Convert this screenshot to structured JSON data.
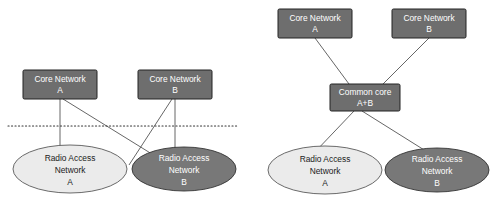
{
  "diagram": {
    "colors": {
      "box_fill": "#6e6e6e",
      "box_stroke": "#222222",
      "ellipse_dark_fill": "#787878",
      "ellipse_dark_stroke": "#333333",
      "ellipse_light_fill": "#ebebeb",
      "ellipse_light_stroke": "#5a5a5a",
      "connector": "#555555",
      "dotted_separator": "#333333",
      "label_on_dark": "#ffffff",
      "label_on_light": "#1a1a1a",
      "background": "#ffffff"
    },
    "left_panel": {
      "name": "separate-core-networks",
      "core_networks": [
        {
          "id": "left-core-a",
          "line1": "Core Network",
          "line2": "A",
          "x": 23,
          "y": 70,
          "w": 74,
          "h": 29
        },
        {
          "id": "left-core-b",
          "line1": "Core Network",
          "line2": "B",
          "x": 138,
          "y": 70,
          "w": 74,
          "h": 29
        }
      ],
      "separator": {
        "id": "left-dotted-separator",
        "x1": 8,
        "x2": 237,
        "y": 126
      },
      "radio_access_networks": [
        {
          "id": "left-ran-a",
          "line1": "Radio Access",
          "line2": "Network",
          "line3": "A",
          "cx": 70,
          "cy": 169,
          "rx": 57,
          "ry": 24,
          "shade": "light"
        },
        {
          "id": "left-ran-b",
          "line1": "Radio Access",
          "line2": "Network",
          "line3": "B",
          "cx": 184,
          "cy": 169,
          "rx": 52,
          "ry": 22,
          "shade": "dark"
        }
      ],
      "connectors": [
        {
          "id": "left-cn-a-to-ran-a",
          "x1": 60,
          "y1": 99,
          "x2": 60,
          "y2": 152
        },
        {
          "id": "left-cn-a-to-ran-b",
          "x1": 63,
          "y1": 99,
          "x2": 158,
          "y2": 158
        },
        {
          "id": "left-cn-b-to-ran-b",
          "x1": 175,
          "y1": 99,
          "x2": 175,
          "y2": 150
        },
        {
          "id": "left-cn-b-to-ran-a",
          "x1": 172,
          "y1": 99,
          "x2": 131,
          "y2": 163
        }
      ]
    },
    "right_panel": {
      "name": "shared-common-core",
      "core_networks": [
        {
          "id": "right-core-a",
          "line1": "Core Network",
          "line2": "A",
          "x": 278,
          "y": 9,
          "w": 74,
          "h": 29
        },
        {
          "id": "right-core-b",
          "line1": "Core Network",
          "line2": "B",
          "x": 392,
          "y": 9,
          "w": 74,
          "h": 29
        }
      ],
      "common_core": {
        "id": "right-common-core",
        "line1": "Common core",
        "line2": "A+B",
        "x": 330,
        "y": 84,
        "w": 70,
        "h": 27
      },
      "radio_access_networks": [
        {
          "id": "right-ran-a",
          "line1": "Radio Access",
          "line2": "Network",
          "line3": "A",
          "cx": 325,
          "cy": 170,
          "rx": 57,
          "ry": 24,
          "shade": "light"
        },
        {
          "id": "right-ran-b",
          "line1": "Radio Access",
          "line2": "Network",
          "line3": "B",
          "cx": 437,
          "cy": 170,
          "rx": 52,
          "ry": 22,
          "shade": "dark"
        }
      ],
      "connectors": [
        {
          "id": "right-cn-a-to-common",
          "x1": 315,
          "y1": 38,
          "x2": 349,
          "y2": 84
        },
        {
          "id": "right-cn-b-to-common",
          "x1": 429,
          "y1": 38,
          "x2": 383,
          "y2": 84
        },
        {
          "id": "right-common-to-ran-a",
          "x1": 354,
          "y1": 111,
          "x2": 315,
          "y2": 152
        },
        {
          "id": "right-common-to-ran-b",
          "x1": 362,
          "y1": 111,
          "x2": 428,
          "y2": 152
        }
      ]
    }
  }
}
